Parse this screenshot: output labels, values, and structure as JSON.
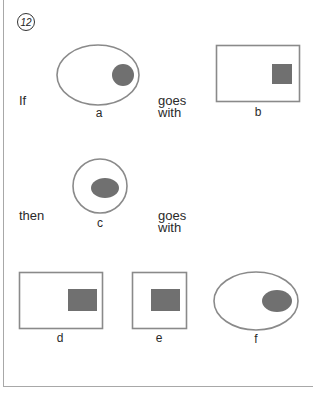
{
  "question": {
    "number": "12"
  },
  "prompt": {
    "if_word": "If",
    "then_word": "then",
    "relation_1": [
      "goes",
      "with"
    ],
    "relation_2": [
      "goes",
      "with"
    ]
  },
  "figures": {
    "a": {
      "label": "a",
      "outer": "ellipse",
      "inner": "circle"
    },
    "b": {
      "label": "b",
      "outer": "rectangle",
      "inner": "square"
    },
    "c": {
      "label": "c",
      "outer": "circle",
      "inner": "ellipse"
    }
  },
  "options": [
    {
      "label": "d",
      "outer": "rectangle",
      "inner": "rectangle"
    },
    {
      "label": "e",
      "outer": "square",
      "inner": "rectangle"
    },
    {
      "label": "f",
      "outer": "ellipse",
      "inner": "ellipse"
    }
  ],
  "colors": {
    "outline": "#8a8a8a",
    "fill": "#707070",
    "frame": "#a8a8a8",
    "text": "#2a2a2a"
  }
}
